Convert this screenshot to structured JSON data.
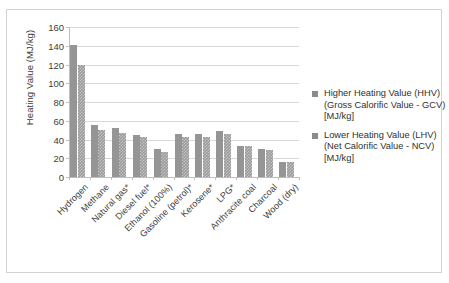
{
  "chart_data": {
    "type": "bar",
    "title": "",
    "xlabel": "",
    "ylabel": "Heating Value (MJ/kg)",
    "ylim": [
      0,
      160
    ],
    "ytick_step": 20,
    "yticks": [
      0,
      20,
      40,
      60,
      80,
      100,
      120,
      140,
      160
    ],
    "grid": true,
    "legend_position": "right",
    "categories": [
      "Hydrogen",
      "Methane",
      "Natural gas*",
      "Diesel fuel*",
      "Ethanol (100%)",
      "Gasoline (petrol)*",
      "Kerosene*",
      "LPG*",
      "Anthracite coal",
      "Charcoal",
      "Wood (dry)"
    ],
    "series": [
      {
        "name": "Higher Heating Value (HHV) (Gross Calorific Value - GCV) [MJ/kg]",
        "short_name": "HHV",
        "color": "#959595",
        "values": [
          141,
          55,
          52,
          45,
          30,
          46,
          46,
          49,
          33,
          30,
          16
        ]
      },
      {
        "name": "Lower Heating Value (LHV) (Net Calorific Value - NCV) [MJ/kg]",
        "short_name": "LHV",
        "color": "#9a9a9a",
        "values": [
          120,
          50,
          47,
          43,
          27,
          43,
          43,
          46,
          33,
          29,
          16
        ]
      }
    ]
  },
  "legend": {
    "entries": [
      {
        "line1": "Higher Heating Value (HHV)",
        "line2": "(Gross Calorific Value - GCV)",
        "line3": "[MJ/kg]"
      },
      {
        "line1": "Lower Heating Value (LHV)",
        "line2": "(Net Calorific Value - NCV)",
        "line3": "[MJ/kg]"
      }
    ]
  },
  "colors": {
    "bar_hhv": "#959595",
    "bar_lhv": "#9a9a9a",
    "gridline": "#d9d9d9",
    "axis": "#bfbfbf",
    "text": "#3d3d3d",
    "frame_border": "#d2d2d2",
    "background": "#ffffff"
  }
}
